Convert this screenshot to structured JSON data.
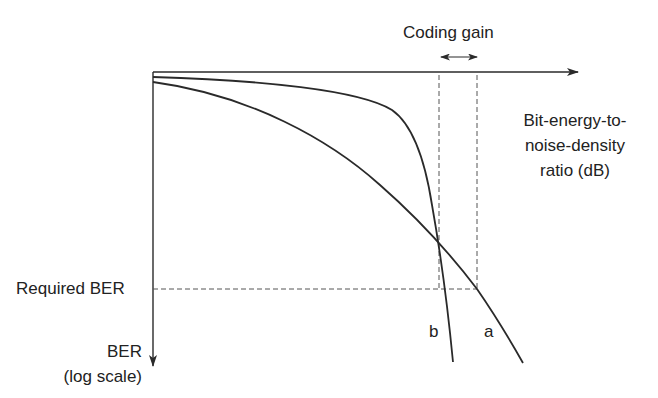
{
  "diagram": {
    "title": "Coding gain",
    "x_axis_label": [
      "Bit-energy-to-",
      "noise-density",
      "ratio (dB)"
    ],
    "y_axis_label": [
      "BER",
      "(log scale)"
    ],
    "required_ber_label": "Required BER",
    "curves": [
      {
        "id": "a",
        "label": "a",
        "description": "uncoded"
      },
      {
        "id": "b",
        "label": "b",
        "description": "coded"
      }
    ],
    "colors": {
      "line": "#2a2a2a",
      "dashed": "#555555",
      "background": "#ffffff"
    }
  }
}
